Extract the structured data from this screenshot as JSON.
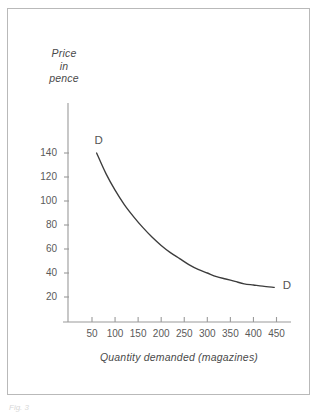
{
  "figure": {
    "caption": "Fig. 3"
  },
  "chart_data": {
    "type": "line",
    "title": "",
    "subtitle": "",
    "xlabel": "Quantity demanded (magazines)",
    "ylabel": "Price in pence",
    "ylabel_lines": [
      "Price",
      "in",
      "pence"
    ],
    "xticks": [
      50,
      100,
      150,
      200,
      250,
      300,
      350,
      400,
      450
    ],
    "xtick_labels": [
      "50",
      "100",
      "150",
      "200",
      "250",
      "300",
      "350",
      "400",
      "450"
    ],
    "yticks": [
      20,
      40,
      60,
      80,
      100,
      120,
      140
    ],
    "ytick_labels": [
      "20",
      "40",
      "60",
      "80",
      "100",
      "120",
      "140"
    ],
    "xlim": [
      0,
      480
    ],
    "ylim": [
      0,
      160
    ],
    "grid": false,
    "legend": "none",
    "series": [
      {
        "name": "D",
        "label_start": "D",
        "label_end": "D",
        "color": "#3c3c3c",
        "x": [
          60,
          80,
          100,
          120,
          140,
          160,
          180,
          200,
          220,
          240,
          260,
          280,
          300,
          320,
          340,
          360,
          380,
          400,
          420,
          445
        ],
        "y": [
          140,
          123,
          109,
          97,
          87,
          78,
          70,
          63,
          57,
          52,
          47,
          43,
          40,
          37,
          35,
          33,
          31,
          30,
          29,
          28
        ]
      }
    ],
    "annotations": [
      {
        "text": "D",
        "x": 60,
        "y": 150
      },
      {
        "text": "D",
        "x": 468,
        "y": 28
      }
    ]
  }
}
